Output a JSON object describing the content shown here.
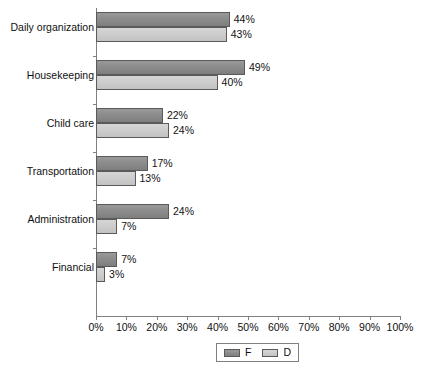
{
  "chart_data": {
    "type": "bar",
    "orientation": "horizontal",
    "title": "",
    "subtitle": "",
    "xlabel": "",
    "ylabel": "",
    "xlim": [
      0,
      100
    ],
    "xtick_labels": [
      "0%",
      "10%",
      "20%",
      "30%",
      "40%",
      "50%",
      "60%",
      "70%",
      "80%",
      "90%",
      "100%"
    ],
    "xticks": [
      0,
      10,
      20,
      30,
      40,
      50,
      60,
      70,
      80,
      90,
      100
    ],
    "grid": false,
    "legend_position": "bottom",
    "categories": [
      "Daily organization",
      "Housekeeping",
      "Child care",
      "Transportation",
      "Administration",
      "Financial"
    ],
    "series": [
      {
        "name": "F",
        "color": "#8c8c8c",
        "values": [
          44,
          49,
          22,
          17,
          24,
          7
        ],
        "labels": [
          "44%",
          "49%",
          "22%",
          "17%",
          "24%",
          "7%"
        ]
      },
      {
        "name": "D",
        "color": "#cdcdcd",
        "values": [
          43,
          40,
          24,
          13,
          7,
          3
        ],
        "labels": [
          "43%",
          "40%",
          "24%",
          "13%",
          "7%",
          "3%"
        ]
      }
    ]
  },
  "legend": {
    "entries": [
      {
        "label": "F",
        "swatch_color": "#8c8c8c"
      },
      {
        "label": "D",
        "swatch_color": "#cdcdcd"
      }
    ]
  },
  "axis": {
    "line_color": "#808080"
  }
}
